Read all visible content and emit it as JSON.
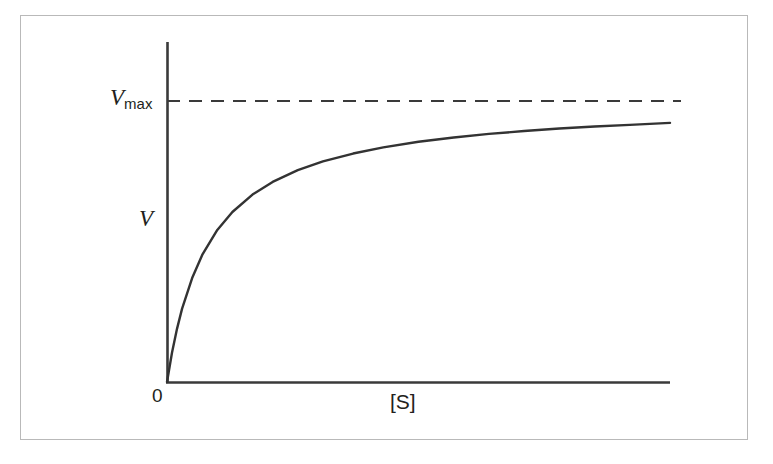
{
  "figure": {
    "background_color": "#ffffff",
    "frame_color": "#b9b9b9",
    "ink_color": "#231f20"
  },
  "labels": {
    "vmax_var": "V",
    "vmax_sub": "max",
    "vmax_full": "Vmax",
    "y_axis": "V",
    "origin": "0",
    "x_axis": "[S]"
  },
  "chart_data": {
    "type": "line",
    "title": "",
    "subtitle": "",
    "xlabel": "[S]",
    "ylabel": "V",
    "grid": false,
    "legend": null,
    "axis_style": {
      "x_axis_from": [
        167,
        382
      ],
      "x_axis_to": [
        670,
        382
      ],
      "y_axis_from": [
        167,
        42
      ],
      "y_axis_to": [
        167,
        382
      ],
      "arrowheads": false,
      "ticks": false,
      "tick_labels": [
        "0"
      ]
    },
    "annotations": [
      {
        "name": "vmax-asymptote",
        "label": "Vmax",
        "style": "dashed",
        "orientation": "horizontal",
        "y_pixel": 101,
        "x_start_pixel": 167,
        "x_end_pixel": 681
      },
      {
        "name": "origin-label",
        "label": "0",
        "x_pixel": 160,
        "y_pixel": 392
      }
    ],
    "series": [
      {
        "name": "Michaelis-Menten velocity curve",
        "equation": "V = Vmax * [S] / (Km + [S])",
        "color": "#333333",
        "line_width": 2.4,
        "vmax_normalized": 1.0,
        "km_normalized": 0.085,
        "x": [
          0,
          0.01,
          0.02,
          0.03,
          0.05,
          0.07,
          0.1,
          0.13,
          0.17,
          0.21,
          0.26,
          0.31,
          0.37,
          0.43,
          0.5,
          0.57,
          0.64,
          0.71,
          0.78,
          0.85,
          0.92,
          1.0
        ],
        "y": [
          0,
          0.105,
          0.19,
          0.261,
          0.37,
          0.452,
          0.541,
          0.605,
          0.667,
          0.712,
          0.754,
          0.785,
          0.813,
          0.835,
          0.855,
          0.87,
          0.883,
          0.893,
          0.902,
          0.909,
          0.915,
          0.922
        ],
        "xlim": [
          0,
          1
        ],
        "ylim": [
          0,
          1.09
        ]
      }
    ]
  }
}
